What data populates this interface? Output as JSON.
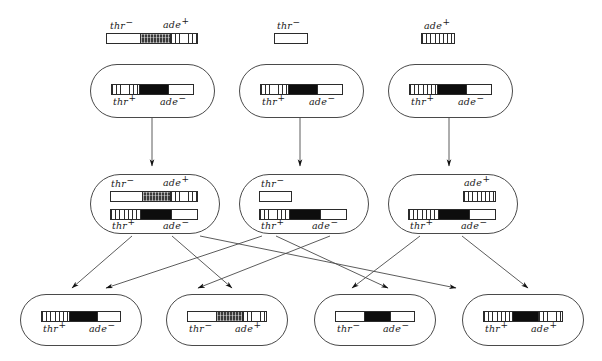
{
  "figure": {
    "colors": {
      "ink": "#1a1a1a",
      "cell_outline": "#4a4a4a",
      "bar_outline": "#2b2b2b",
      "black_segment": "#0d0d0d",
      "background": "#ffffff"
    },
    "allele_labels": {
      "thr_minus": "thr",
      "thr_plus": "thr",
      "ade_minus": "ade",
      "ade_plus": "ade",
      "sup_minus": "−",
      "sup_plus": "+"
    }
  },
  "donor_fragments": [
    {
      "id": "fragment-thr-minus-ade-plus",
      "left_label": "thr",
      "left_sup": "−",
      "right_label": "ade",
      "right_sup": "+",
      "segments": [
        "white",
        "stipple",
        "hatch"
      ]
    },
    {
      "id": "fragment-thr-minus",
      "left_label": "thr",
      "left_sup": "−",
      "right_label": "",
      "right_sup": "",
      "segments": [
        "white"
      ]
    },
    {
      "id": "fragment-ade-plus",
      "left_label": "",
      "left_sup": "",
      "right_label": "ade",
      "right_sup": "+",
      "segments": [
        "hatch"
      ]
    }
  ],
  "row1_cells": [
    {
      "id": "recipient-cell-1",
      "chromosome": {
        "segments": [
          "hatch",
          "black",
          "white"
        ],
        "left_label": "thr",
        "left_sup": "+",
        "right_label": "ade",
        "right_sup": "−"
      }
    },
    {
      "id": "recipient-cell-2",
      "chromosome": {
        "segments": [
          "hatch",
          "black",
          "white"
        ],
        "left_label": "thr",
        "left_sup": "+",
        "right_label": "ade",
        "right_sup": "−"
      }
    },
    {
      "id": "recipient-cell-3",
      "chromosome": {
        "segments": [
          "hatch",
          "black",
          "white"
        ],
        "left_label": "thr",
        "left_sup": "+",
        "right_label": "ade",
        "right_sup": "−"
      }
    }
  ],
  "row2_cells": [
    {
      "id": "merozygote-cell-1",
      "fragment": {
        "segments": [
          "white",
          "stipple",
          "hatch"
        ],
        "left_label": "thr",
        "left_sup": "−",
        "right_label": "ade",
        "right_sup": "+"
      },
      "chromosome": {
        "segments": [
          "hatch",
          "black",
          "white"
        ],
        "left_label": "thr",
        "left_sup": "+",
        "right_label": "ade",
        "right_sup": "−"
      }
    },
    {
      "id": "merozygote-cell-2",
      "fragment": {
        "segments": [
          "white"
        ],
        "left_label": "thr",
        "left_sup": "−",
        "right_label": "",
        "right_sup": ""
      },
      "chromosome": {
        "segments": [
          "hatch",
          "black",
          "white"
        ],
        "left_label": "thr",
        "left_sup": "+",
        "right_label": "ade",
        "right_sup": "−"
      }
    },
    {
      "id": "merozygote-cell-3",
      "fragment": {
        "segments": [
          "hatch"
        ],
        "left_label": "",
        "left_sup": "",
        "right_label": "ade",
        "right_sup": "+"
      },
      "chromosome": {
        "segments": [
          "hatch",
          "black",
          "white"
        ],
        "left_label": "thr",
        "left_sup": "+",
        "right_label": "ade",
        "right_sup": "−"
      }
    }
  ],
  "row3_cells": [
    {
      "id": "progeny-cell-thr-plus-ade-minus",
      "chromosome": {
        "segments": [
          "hatch",
          "black",
          "white"
        ],
        "left_label": "thr",
        "left_sup": "+",
        "right_label": "ade",
        "right_sup": "−"
      }
    },
    {
      "id": "progeny-cell-thr-minus-ade-plus",
      "chromosome": {
        "segments": [
          "white",
          "stipple",
          "hatch"
        ],
        "left_label": "thr",
        "left_sup": "−",
        "right_label": "ade",
        "right_sup": "+"
      }
    },
    {
      "id": "progeny-cell-thr-minus-ade-minus",
      "chromosome": {
        "segments": [
          "white",
          "black",
          "white"
        ],
        "left_label": "thr",
        "left_sup": "−",
        "right_label": "ade",
        "right_sup": "−"
      }
    },
    {
      "id": "progeny-cell-thr-plus-ade-plus",
      "chromosome": {
        "segments": [
          "hatch",
          "black",
          "hatch"
        ],
        "left_label": "thr",
        "left_sup": "+",
        "right_label": "ade",
        "right_sup": "+"
      }
    }
  ],
  "arrows": {
    "vertical": [
      {
        "id": "arrow-cell1-to-merozygote1",
        "x1": 152,
        "y1": 118,
        "x2": 152,
        "y2": 166
      },
      {
        "id": "arrow-cell2-to-merozygote2",
        "x1": 300,
        "y1": 118,
        "x2": 300,
        "y2": 166
      },
      {
        "id": "arrow-cell3-to-merozygote3",
        "x1": 449,
        "y1": 118,
        "x2": 449,
        "y2": 166
      }
    ],
    "crossing": [
      {
        "id": "arrow-m1-to-p1",
        "x1": 132,
        "y1": 236,
        "x2": 72,
        "y2": 288
      },
      {
        "id": "arrow-m1-to-p2",
        "x1": 172,
        "y1": 236,
        "x2": 232,
        "y2": 288
      },
      {
        "id": "arrow-m2-to-p1",
        "x1": 262,
        "y1": 236,
        "x2": 106,
        "y2": 288
      },
      {
        "id": "arrow-m2-to-p3",
        "x1": 276,
        "y1": 236,
        "x2": 388,
        "y2": 288
      },
      {
        "id": "arrow-m2-to-p2",
        "x1": 330,
        "y1": 236,
        "x2": 198,
        "y2": 288
      },
      {
        "id": "arrow-m3-to-p3",
        "x1": 420,
        "y1": 236,
        "x2": 352,
        "y2": 288
      },
      {
        "id": "arrow-m3-to-p4",
        "x1": 462,
        "y1": 236,
        "x2": 528,
        "y2": 288
      },
      {
        "id": "arrow-m1-far-to-p4",
        "x1": 200,
        "y1": 236,
        "x2": 456,
        "y2": 288
      }
    ]
  }
}
